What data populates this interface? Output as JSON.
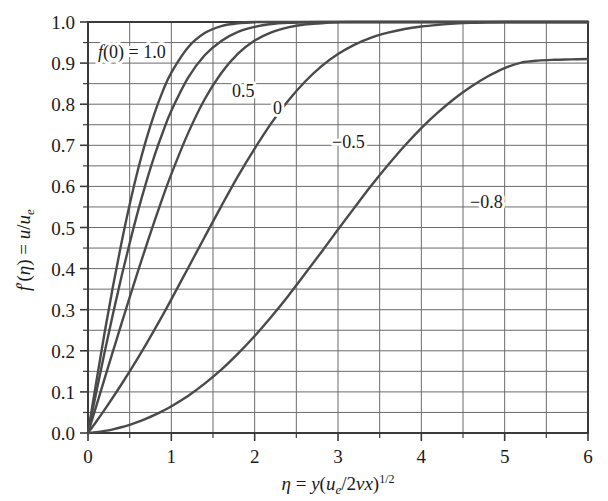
{
  "figure": {
    "background_color": "#ffffff",
    "plot_border_color": "#3a3a3a",
    "grid_color": "#6b6b6b",
    "curve_color": "#4a4a4a"
  },
  "axes": {
    "x": {
      "label_parts": {
        "eta": "η",
        "equals": " = ",
        "y": "y",
        "open": "(",
        "u": "u",
        "u_sub": "e",
        "slash": "/2",
        "nu": "ν",
        "x": "x",
        "close": ")",
        "exponent": "1/2"
      },
      "label_plain": "η = y(u_e/2νx)^(1/2)",
      "ticks": [
        "0",
        "1",
        "2",
        "3",
        "4",
        "5",
        "6"
      ],
      "range": [
        0,
        6
      ],
      "major_step": 1,
      "grid_step": 0.5
    },
    "y": {
      "label_parts": {
        "f": "f",
        "prime": "′",
        "open": "(",
        "eta": "η",
        "close": ")",
        "equals": " = ",
        "u": "u",
        "slash": "/",
        "u2": "u",
        "u_sub": "e"
      },
      "label_plain": "f′(η) = u/u_e",
      "ticks": [
        "0.0",
        "0.1",
        "0.2",
        "0.3",
        "0.4",
        "0.5",
        "0.6",
        "0.7",
        "0.8",
        "0.9",
        "1.0"
      ],
      "range": [
        0,
        1
      ],
      "major_step": 0.1,
      "grid_step": 0.05
    }
  },
  "curve_labels": [
    {
      "id": "fw-1.0",
      "text": "f(0) = 1.0",
      "x_px": 98,
      "y_px": 58,
      "rich": true
    },
    {
      "id": "fw-0.5",
      "text": "0.5",
      "x_px": 232,
      "y_px": 97,
      "rich": false
    },
    {
      "id": "fw-0",
      "text": "0",
      "x_px": 273,
      "y_px": 114,
      "rich": false
    },
    {
      "id": "fw--0.5",
      "text": "−0.5",
      "x_px": 332,
      "y_px": 148,
      "rich": false
    },
    {
      "id": "fw--0.8",
      "text": "−0.8",
      "x_px": 470,
      "y_px": 208,
      "rich": false
    }
  ],
  "chart_data": {
    "type": "line",
    "title": "",
    "xlabel": "η = y(u_e/2νx)^(1/2)",
    "ylabel": "f′(η) = u/u_e",
    "xlim": [
      0,
      6
    ],
    "ylim": [
      0,
      1
    ],
    "grid": true,
    "legend": "inline-curve-labels",
    "x_ticks": [
      0,
      1,
      2,
      3,
      4,
      5,
      6
    ],
    "y_ticks": [
      0.0,
      0.1,
      0.2,
      0.3,
      0.4,
      0.5,
      0.6,
      0.7,
      0.8,
      0.9,
      1.0
    ],
    "x": [
      0,
      0.1,
      0.2,
      0.3,
      0.4,
      0.5,
      0.6,
      0.7,
      0.8,
      0.9,
      1.0,
      1.2,
      1.4,
      1.6,
      1.8,
      2.0,
      2.2,
      2.4,
      2.6,
      2.8,
      3.0,
      3.2,
      3.4,
      3.6,
      3.8,
      4.0,
      4.2,
      4.4,
      4.6,
      4.8,
      5.0,
      5.2,
      5.4,
      5.6,
      5.8,
      6.0
    ],
    "series": [
      {
        "name": "f(0) = 1.0",
        "label": "f(0) = 1.0",
        "fw": 1.0,
        "values": [
          0.0,
          0.125,
          0.245,
          0.357,
          0.461,
          0.556,
          0.641,
          0.715,
          0.779,
          0.833,
          0.877,
          0.938,
          0.973,
          0.99,
          0.997,
          0.999,
          1.0,
          1.0,
          1.0,
          1.0,
          1.0,
          1.0,
          1.0,
          1.0,
          1.0,
          1.0,
          1.0,
          1.0,
          1.0,
          1.0,
          1.0,
          1.0,
          1.0,
          1.0,
          1.0,
          1.0
        ]
      },
      {
        "name": "0.5",
        "label": "0.5",
        "fw": 0.5,
        "values": [
          0.0,
          0.1,
          0.197,
          0.29,
          0.379,
          0.462,
          0.54,
          0.611,
          0.676,
          0.733,
          0.784,
          0.864,
          0.919,
          0.954,
          0.976,
          0.988,
          0.995,
          0.998,
          0.999,
          1.0,
          1.0,
          1.0,
          1.0,
          1.0,
          1.0,
          1.0,
          1.0,
          1.0,
          1.0,
          1.0,
          1.0,
          1.0,
          1.0,
          1.0,
          1.0,
          1.0
        ]
      },
      {
        "name": "0",
        "label": "0",
        "fw": 0.0,
        "values": [
          0.0,
          0.066,
          0.133,
          0.199,
          0.265,
          0.33,
          0.394,
          0.456,
          0.517,
          0.575,
          0.63,
          0.729,
          0.812,
          0.876,
          0.923,
          0.955,
          0.975,
          0.987,
          0.994,
          0.997,
          0.999,
          1.0,
          1.0,
          1.0,
          1.0,
          1.0,
          1.0,
          1.0,
          1.0,
          1.0,
          1.0,
          1.0,
          1.0,
          1.0,
          1.0,
          1.0
        ]
      },
      {
        "name": "-0.5",
        "label": "−0.5",
        "fw": -0.5,
        "values": [
          0.0,
          0.028,
          0.057,
          0.087,
          0.118,
          0.15,
          0.183,
          0.217,
          0.252,
          0.288,
          0.325,
          0.401,
          0.477,
          0.552,
          0.625,
          0.692,
          0.754,
          0.808,
          0.854,
          0.892,
          0.922,
          0.945,
          0.962,
          0.974,
          0.983,
          0.989,
          0.993,
          0.996,
          0.998,
          0.999,
          1.0,
          1.0,
          1.0,
          1.0,
          1.0,
          1.0
        ]
      },
      {
        "name": "-0.8",
        "label": "−0.8",
        "fw": -0.8,
        "values": [
          0.0,
          0.002,
          0.005,
          0.009,
          0.014,
          0.02,
          0.027,
          0.035,
          0.044,
          0.054,
          0.065,
          0.09,
          0.12,
          0.154,
          0.193,
          0.236,
          0.283,
          0.333,
          0.386,
          0.44,
          0.495,
          0.549,
          0.602,
          0.652,
          0.699,
          0.742,
          0.78,
          0.814,
          0.843,
          0.868,
          0.888,
          0.901,
          0.906,
          0.908,
          0.909,
          0.91
        ]
      }
    ]
  }
}
